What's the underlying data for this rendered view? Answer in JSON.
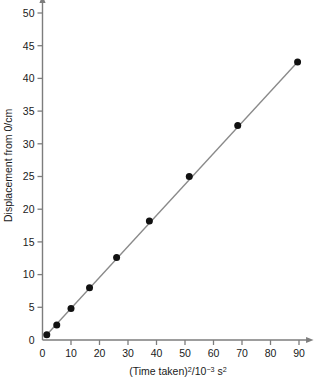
{
  "chart_data": {
    "type": "scatter",
    "title": "",
    "subtitle": "",
    "xlabel": "(Time taken)2/10-3 s2",
    "xlabel_parts": {
      "base1": "(Time taken)",
      "exp1": "2",
      "slash": "/10",
      "exp2": "−3",
      "base2": " s",
      "exp3": "2"
    },
    "ylabel": "Displacement from 0/cm",
    "xlim": [
      0,
      93
    ],
    "ylim": [
      0,
      51
    ],
    "xticks": [
      0,
      10,
      20,
      30,
      40,
      50,
      60,
      70,
      80,
      90
    ],
    "yticks": [
      0,
      5,
      10,
      15,
      20,
      25,
      30,
      35,
      40,
      45,
      50
    ],
    "xticklabels": [
      "0",
      "10",
      "20",
      "30",
      "40",
      "50",
      "60",
      "70",
      "80",
      "90"
    ],
    "yticklabels": [
      "0",
      "5",
      "10",
      "15",
      "20",
      "25",
      "30",
      "35",
      "40",
      "45",
      "50"
    ],
    "grid": false,
    "legend": false,
    "legend_position": "none",
    "series": [
      {
        "name": "Displacement vs (time taken) squared",
        "marker": "filled-circle",
        "marker_color": "#111111",
        "line_color": "#8a8a8a",
        "line_style": "solid",
        "x": [
          1.5,
          5.0,
          10.0,
          16.5,
          26.0,
          37.5,
          51.5,
          68.5,
          89.5
        ],
        "y": [
          0.8,
          2.3,
          4.8,
          8.0,
          12.6,
          18.2,
          25.0,
          32.8,
          42.5
        ]
      }
    ],
    "trendline": {
      "type": "best-fit-line",
      "color": "#8a8a8a",
      "from": [
        1.5,
        0.8
      ],
      "to": [
        89.5,
        42.5
      ]
    },
    "axis_color": "#7d7d7d",
    "axis_arrow_x": true,
    "axis_arrow_y": true
  },
  "colors": {
    "background": "#ffffff",
    "axis": "#7d7d7d",
    "marker": "#111111",
    "line": "#8a8a8a",
    "text": "#1a1a1a"
  }
}
